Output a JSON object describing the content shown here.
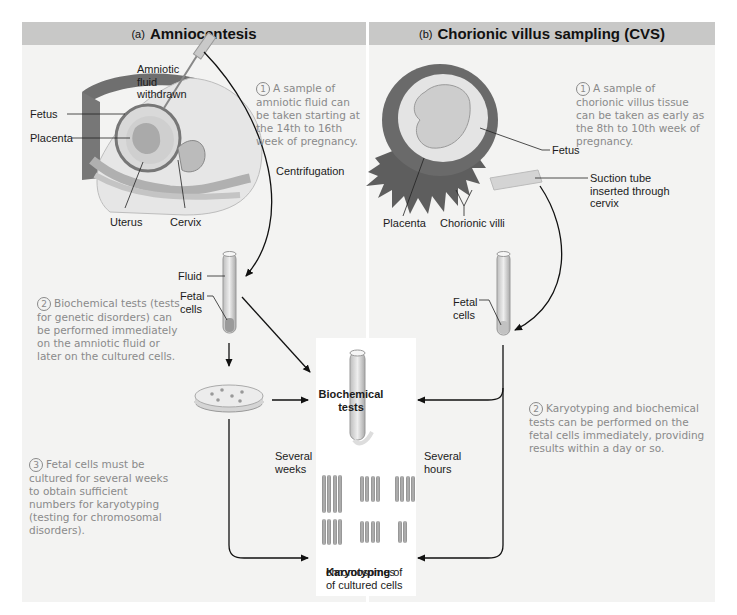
{
  "panels": {
    "a": {
      "tag": "(a)",
      "title": "Amniocentesis",
      "labels": {
        "amniotic_fluid": "Amniotic\nfluid\nwithdrawn",
        "fetus": "Fetus",
        "placenta": "Placenta",
        "uterus": "Uterus",
        "cervix": "Cervix",
        "centrifugation": "Centrifugation",
        "fluid": "Fluid",
        "fetal_cells": "Fetal\ncells",
        "several_weeks": "Several\nweeks"
      },
      "steps": [
        {
          "num": "1",
          "text": "A sample of\namniotic fluid can\nbe taken starting at\nthe 14th to 16th\nweek of pregnancy."
        },
        {
          "num": "2",
          "text": "Biochemical tests (tests\nfor genetic disorders) can\nbe performed immediately\non the amniotic fluid or\nlater on the cultured cells."
        },
        {
          "num": "3",
          "text": "Fetal cells must be\ncultured for several weeks\nto obtain sufficient\nnumbers for karyotyping\n(testing for chromosomal\ndisorders)."
        }
      ]
    },
    "b": {
      "tag": "(b)",
      "title": "Chorionic villus sampling (CVS)",
      "labels": {
        "fetus": "Fetus",
        "suction_tube": "Suction tube\ninserted through\ncervix",
        "placenta": "Placenta",
        "chorionic_villi": "Chorionic villi",
        "fetal_cells": "Fetal\ncells",
        "several_hours": "Several\nhours"
      },
      "steps": [
        {
          "num": "1",
          "text": "A sample of\nchorionic villus tissue\ncan be taken as early as\nthe 8th to 10th week of\npregnancy."
        },
        {
          "num": "2",
          "text": "Karyotyping and biochemical\ntests can be performed on the\nfetal cells immediately, providing\nresults within a day or so."
        }
      ]
    }
  },
  "center": {
    "biochemical_tests": "Biochemical\ntests",
    "karyotyping_bold": "Karyotyping",
    "karyotyping_rest": " of",
    "karyotyping_line2": "chromosomes\nof cultured cells"
  },
  "colors": {
    "header_bg": "#c8c8c7",
    "panel_bg": "#f3f3f2",
    "step_text": "#8a8a8a",
    "label_text": "#1b1b1b"
  }
}
